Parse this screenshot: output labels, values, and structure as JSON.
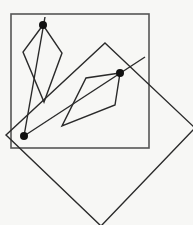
{
  "diagram": {
    "width": 193,
    "height": 225,
    "background": "#f7f7f5",
    "stroke_color": "#2a2a2a",
    "square_stroke_color": "#555555",
    "axis_aligned_square": {
      "x1": 11,
      "y1": 14,
      "x2": 149,
      "y2": 148
    },
    "rotated_square": {
      "points": "105,43 195,128 101,226 6,135"
    },
    "left_kite": {
      "points": "43,25 23,52 44,102 62,53"
    },
    "right_kite": {
      "points": "120,73 86,78 62,126 115,105"
    },
    "line_vertical": {
      "x1": 45,
      "y1": 17,
      "x2": 24,
      "y2": 136
    },
    "line_diagonal": {
      "x1": 24,
      "y1": 136,
      "x2": 145,
      "y2": 57
    },
    "points": [
      {
        "id": "top-dot",
        "cx": 43,
        "cy": 25,
        "r": 4
      },
      {
        "id": "right-dot",
        "cx": 120,
        "cy": 73,
        "r": 4
      },
      {
        "id": "bottom-left-dot",
        "cx": 24,
        "cy": 136,
        "r": 4
      }
    ]
  }
}
